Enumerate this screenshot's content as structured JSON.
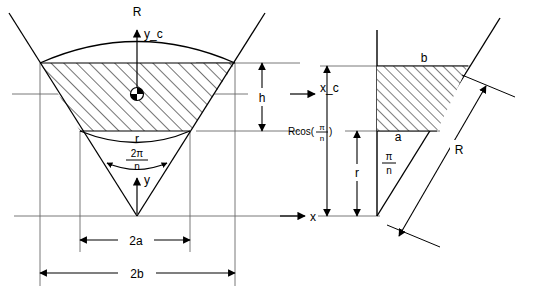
{
  "figure": {
    "type": "engineering-geometry-diagram",
    "background_color": "#ffffff",
    "line_color": "#000000",
    "thin_line_color": "#555555",
    "hatch_color": "#000000"
  },
  "left_figure": {
    "name": "wedge-segment-view",
    "labels": {
      "outer_radius": "R",
      "centroid_y_axis": "y_c",
      "centroid_x_axis": "x_c",
      "height": "h",
      "inner_radius": "r",
      "central_angle_numerator": "2π",
      "central_angle_denominator": "n",
      "y_axis": "y",
      "x_axis": "x",
      "half_width_inner": "2a",
      "half_width_outer": "2b"
    },
    "geometry": {
      "apex_x": 137,
      "apex_y": 216,
      "top_left_x": 40,
      "top_right_x": 235,
      "top_y": 63,
      "bottom_left_x": 80,
      "bottom_right_x": 190,
      "bottom_y": 131,
      "axis_y": 216
    }
  },
  "right_figure": {
    "name": "trapezoid-detail-view",
    "labels": {
      "top_width": "b",
      "bottom_width": "a",
      "radius": "R",
      "apothem_prefix": "Rcos(",
      "apothem_numerator": "π",
      "apothem_denominator": "n",
      "apothem_suffix": ")",
      "inner_radius": "r",
      "half_angle_numerator": "π",
      "half_angle_denominator": "n"
    },
    "geometry": {
      "vertical_edge_x": 377,
      "apex_y": 216,
      "top_y": 66,
      "mid_y": 131,
      "top_right_x": 468,
      "mid_right_x": 437
    }
  },
  "annotations": {
    "centroid_marker": "quartered-circle",
    "hatch_style": "diagonal-45-degree"
  }
}
